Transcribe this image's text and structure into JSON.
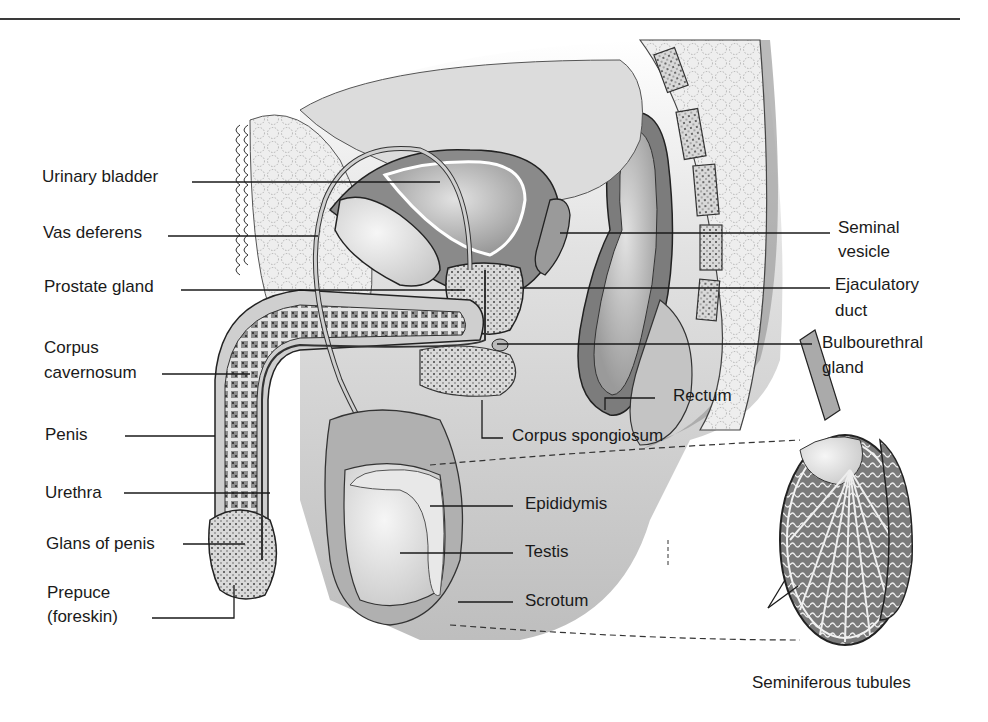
{
  "figure": {
    "type": "anatomical-diagram",
    "palette": {
      "background": "#ffffff",
      "line": "#1a1a1a",
      "tissue_light": "#e6e6e6",
      "tissue_mid": "#b4b4b4",
      "tissue_dark": "#8a8a8a",
      "text": "#1a1a1a"
    }
  },
  "labels_left": [
    {
      "id": "urinary-bladder",
      "text": "Urinary bladder"
    },
    {
      "id": "vas-deferens",
      "text": "Vas deferens"
    },
    {
      "id": "prostate-gland",
      "text": "Prostate gland"
    },
    {
      "id": "corpus-cavernosum",
      "line1": "Corpus",
      "line2": "cavernosum"
    },
    {
      "id": "penis",
      "text": "Penis"
    },
    {
      "id": "urethra",
      "text": "Urethra"
    },
    {
      "id": "glans-of-penis",
      "text": "Glans of penis"
    },
    {
      "id": "prepuce",
      "line1": "Prepuce",
      "line2": "(foreskin)"
    }
  ],
  "labels_right": [
    {
      "id": "seminal-vesicle",
      "line1": "Seminal",
      "line2": "vesicle"
    },
    {
      "id": "ejaculatory-duct",
      "line1": "Ejaculatory",
      "line2": "duct"
    },
    {
      "id": "bulbourethral-gland",
      "line1": "Bulbourethral",
      "line2": "gland"
    }
  ],
  "labels_center": [
    {
      "id": "rectum",
      "text": "Rectum"
    },
    {
      "id": "corpus-spongiosum",
      "text": "Corpus spongiosum"
    },
    {
      "id": "epididymis",
      "text": "Epididymis"
    },
    {
      "id": "testis",
      "text": "Testis"
    },
    {
      "id": "scrotum",
      "text": "Scrotum"
    }
  ],
  "labels_detail": [
    {
      "id": "seminiferous-tubules",
      "text": "Seminiferous tubules"
    }
  ]
}
